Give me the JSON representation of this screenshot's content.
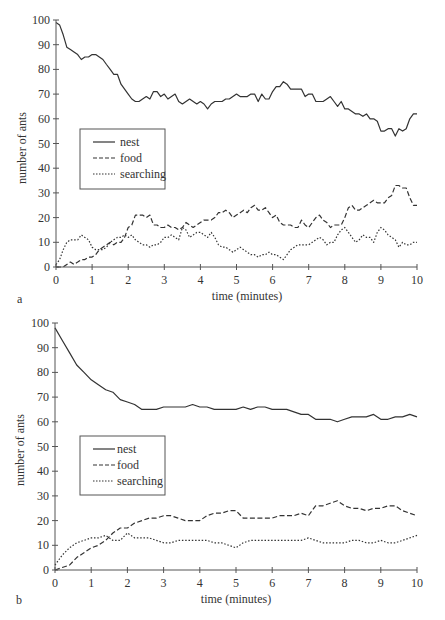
{
  "chart_data": [
    {
      "panel": "a",
      "type": "line",
      "title": "",
      "xlabel": "time (minutes)",
      "ylabel": "number of ants",
      "xlim": [
        0,
        10
      ],
      "ylim": [
        0,
        100
      ],
      "xticks": [
        0,
        1,
        2,
        3,
        4,
        5,
        6,
        7,
        8,
        9,
        10
      ],
      "yticks": [
        0,
        10,
        20,
        30,
        40,
        50,
        60,
        70,
        80,
        90,
        100
      ],
      "grid": false,
      "legend_position": "inside-left-middle",
      "legend": [
        "nest",
        "food",
        "searching"
      ],
      "series": [
        {
          "name": "nest",
          "style": "solid",
          "x": [
            0,
            0.1,
            0.2,
            0.3,
            0.4,
            0.5,
            0.6,
            0.7,
            0.8,
            0.9,
            1.0,
            1.1,
            1.2,
            1.3,
            1.4,
            1.5,
            1.6,
            1.7,
            1.8,
            1.9,
            2.0,
            2.1,
            2.2,
            2.3,
            2.4,
            2.5,
            2.6,
            2.7,
            2.8,
            2.9,
            3.0,
            3.1,
            3.2,
            3.3,
            3.4,
            3.5,
            3.6,
            3.7,
            3.8,
            3.9,
            4.0,
            4.1,
            4.2,
            4.3,
            4.4,
            4.5,
            4.6,
            4.7,
            4.8,
            4.9,
            5.0,
            5.1,
            5.2,
            5.3,
            5.4,
            5.5,
            5.6,
            5.7,
            5.8,
            5.9,
            6.0,
            6.1,
            6.2,
            6.3,
            6.4,
            6.5,
            6.6,
            6.7,
            6.8,
            6.9,
            7.0,
            7.1,
            7.2,
            7.3,
            7.4,
            7.5,
            7.6,
            7.7,
            7.8,
            7.9,
            8.0,
            8.1,
            8.2,
            8.3,
            8.4,
            8.5,
            8.6,
            8.7,
            8.8,
            8.9,
            9.0,
            9.1,
            9.2,
            9.3,
            9.4,
            9.5,
            9.6,
            9.7,
            9.8,
            9.9,
            10.0
          ],
          "values": [
            99,
            98,
            94,
            89,
            88,
            87,
            86,
            84,
            85,
            85,
            86,
            86,
            85,
            84,
            82,
            80,
            78,
            78,
            74,
            72,
            70,
            68,
            67,
            67,
            68,
            69,
            68,
            71,
            71,
            69,
            70,
            68,
            69,
            70,
            67,
            66,
            67,
            68,
            67,
            66,
            67,
            66,
            64,
            66,
            67,
            67,
            67,
            68,
            68,
            69,
            70,
            69,
            69,
            69,
            70,
            70,
            67,
            70,
            68,
            68,
            71,
            73,
            73,
            75,
            74,
            72,
            72,
            72,
            72,
            69,
            70,
            70,
            67,
            67,
            67,
            68,
            69,
            67,
            65,
            67,
            64,
            64,
            63,
            62,
            62,
            61,
            62,
            60,
            60,
            59,
            55,
            55,
            56,
            56,
            53,
            56,
            55,
            56,
            60,
            62,
            62
          ]
        },
        {
          "name": "food",
          "style": "dashed",
          "x": [
            0,
            0.1,
            0.2,
            0.3,
            0.4,
            0.5,
            0.6,
            0.7,
            0.8,
            0.9,
            1.0,
            1.1,
            1.2,
            1.3,
            1.4,
            1.5,
            1.6,
            1.7,
            1.8,
            1.9,
            2.0,
            2.1,
            2.2,
            2.3,
            2.4,
            2.5,
            2.6,
            2.7,
            2.8,
            2.9,
            3.0,
            3.1,
            3.2,
            3.3,
            3.4,
            3.5,
            3.6,
            3.7,
            3.8,
            3.9,
            4.0,
            4.1,
            4.2,
            4.3,
            4.4,
            4.5,
            4.6,
            4.7,
            4.8,
            4.9,
            5.0,
            5.1,
            5.2,
            5.3,
            5.4,
            5.5,
            5.6,
            5.7,
            5.8,
            5.9,
            6.0,
            6.1,
            6.2,
            6.3,
            6.4,
            6.5,
            6.6,
            6.7,
            6.8,
            6.9,
            7.0,
            7.1,
            7.2,
            7.3,
            7.4,
            7.5,
            7.6,
            7.7,
            7.8,
            7.9,
            8.0,
            8.1,
            8.2,
            8.3,
            8.4,
            8.5,
            8.6,
            8.7,
            8.8,
            8.9,
            9.0,
            9.1,
            9.2,
            9.3,
            9.4,
            9.5,
            9.6,
            9.7,
            9.8,
            9.9,
            10.0
          ],
          "values": [
            0,
            0,
            0,
            1,
            2,
            1,
            2,
            3,
            3,
            4,
            4,
            5,
            7,
            8,
            9,
            10,
            9,
            10,
            10,
            12,
            16,
            17,
            21,
            21,
            21,
            20,
            21,
            17,
            17,
            16,
            16,
            17,
            16,
            16,
            15,
            16,
            18,
            17,
            16,
            17,
            18,
            19,
            19,
            19,
            20,
            22,
            22,
            23,
            22,
            20,
            21,
            22,
            23,
            22,
            24,
            25,
            23,
            23,
            24,
            22,
            20,
            21,
            18,
            17,
            17,
            17,
            16,
            16,
            19,
            17,
            16,
            18,
            20,
            21,
            19,
            18,
            16,
            17,
            17,
            17,
            20,
            24,
            25,
            23,
            23,
            24,
            25,
            26,
            27,
            26,
            26,
            26,
            28,
            29,
            33,
            33,
            32,
            32,
            28,
            25,
            25
          ]
        },
        {
          "name": "searching",
          "style": "dotted",
          "x": [
            0,
            0.1,
            0.2,
            0.3,
            0.4,
            0.5,
            0.6,
            0.7,
            0.8,
            0.9,
            1.0,
            1.1,
            1.2,
            1.3,
            1.4,
            1.5,
            1.6,
            1.7,
            1.8,
            1.9,
            2.0,
            2.1,
            2.2,
            2.3,
            2.4,
            2.5,
            2.6,
            2.7,
            2.8,
            2.9,
            3.0,
            3.1,
            3.2,
            3.3,
            3.4,
            3.5,
            3.6,
            3.7,
            3.8,
            3.9,
            4.0,
            4.1,
            4.2,
            4.3,
            4.4,
            4.5,
            4.6,
            4.7,
            4.8,
            4.9,
            5.0,
            5.1,
            5.2,
            5.3,
            5.4,
            5.5,
            5.6,
            5.7,
            5.8,
            5.9,
            6.0,
            6.1,
            6.2,
            6.3,
            6.4,
            6.5,
            6.6,
            6.7,
            6.8,
            6.9,
            7.0,
            7.1,
            7.2,
            7.3,
            7.4,
            7.5,
            7.6,
            7.7,
            7.8,
            7.9,
            8.0,
            8.1,
            8.2,
            8.3,
            8.4,
            8.5,
            8.6,
            8.7,
            8.8,
            8.9,
            9.0,
            9.1,
            9.2,
            9.3,
            9.4,
            9.5,
            9.6,
            9.7,
            9.8,
            9.9,
            10.0
          ],
          "values": [
            1,
            3,
            7,
            10,
            11,
            11,
            11,
            13,
            12,
            11,
            8,
            7,
            7,
            7,
            8,
            10,
            11,
            12,
            12,
            13,
            12,
            13,
            11,
            10,
            9,
            9,
            8,
            9,
            9,
            10,
            12,
            12,
            13,
            12,
            11,
            16,
            15,
            12,
            13,
            14,
            14,
            13,
            12,
            14,
            12,
            9,
            8,
            8,
            7,
            6,
            7,
            8,
            7,
            6,
            5,
            5,
            4,
            5,
            5,
            6,
            5,
            5,
            4,
            3,
            5,
            7,
            8,
            9,
            9,
            9,
            9,
            10,
            11,
            12,
            11,
            9,
            10,
            10,
            13,
            15,
            16,
            14,
            12,
            10,
            11,
            13,
            12,
            12,
            10,
            14,
            16,
            15,
            13,
            12,
            11,
            8,
            10,
            9,
            9,
            10,
            10
          ]
        }
      ]
    },
    {
      "panel": "b",
      "type": "line",
      "title": "",
      "xlabel": "time (minutes)",
      "ylabel": "number of ants",
      "xlim": [
        0,
        10
      ],
      "ylim": [
        0,
        100
      ],
      "xticks": [
        0,
        1,
        2,
        3,
        4,
        5,
        6,
        7,
        8,
        9,
        10
      ],
      "yticks": [
        0,
        10,
        20,
        30,
        40,
        50,
        60,
        70,
        80,
        90,
        100
      ],
      "grid": false,
      "legend_position": "inside-left-middle",
      "legend": [
        "nest",
        "food",
        "searching"
      ],
      "series": [
        {
          "name": "nest",
          "style": "solid",
          "x": [
            0,
            0.2,
            0.4,
            0.6,
            0.8,
            1.0,
            1.2,
            1.4,
            1.6,
            1.8,
            2.0,
            2.2,
            2.4,
            2.6,
            2.8,
            3.0,
            3.2,
            3.4,
            3.6,
            3.8,
            4.0,
            4.2,
            4.4,
            4.6,
            4.8,
            5.0,
            5.2,
            5.4,
            5.6,
            5.8,
            6.0,
            6.2,
            6.4,
            6.6,
            6.8,
            7.0,
            7.2,
            7.4,
            7.6,
            7.8,
            8.0,
            8.2,
            8.4,
            8.6,
            8.8,
            9.0,
            9.2,
            9.4,
            9.6,
            9.8,
            10.0
          ],
          "values": [
            98,
            93,
            88,
            83,
            80,
            77,
            75,
            73,
            72,
            69,
            68,
            67,
            65,
            65,
            65,
            66,
            66,
            66,
            66,
            67,
            66,
            66,
            65,
            65,
            65,
            65,
            66,
            65,
            66,
            66,
            65,
            65,
            65,
            64,
            63,
            63,
            61,
            61,
            61,
            60,
            61,
            62,
            62,
            62,
            63,
            61,
            61,
            62,
            62,
            63,
            62
          ]
        },
        {
          "name": "food",
          "style": "dashed",
          "x": [
            0,
            0.2,
            0.4,
            0.6,
            0.8,
            1.0,
            1.2,
            1.4,
            1.6,
            1.8,
            2.0,
            2.2,
            2.4,
            2.6,
            2.8,
            3.0,
            3.2,
            3.4,
            3.6,
            3.8,
            4.0,
            4.2,
            4.4,
            4.6,
            4.8,
            5.0,
            5.2,
            5.4,
            5.6,
            5.8,
            6.0,
            6.2,
            6.4,
            6.6,
            6.8,
            7.0,
            7.2,
            7.4,
            7.6,
            7.8,
            8.0,
            8.2,
            8.4,
            8.6,
            8.8,
            9.0,
            9.2,
            9.4,
            9.6,
            9.8,
            10.0
          ],
          "values": [
            0,
            1,
            2,
            5,
            7,
            9,
            10,
            12,
            15,
            17,
            17,
            19,
            20,
            21,
            21,
            22,
            22,
            21,
            20,
            20,
            20,
            22,
            23,
            23,
            24,
            24,
            21,
            21,
            21,
            21,
            21,
            22,
            22,
            22,
            23,
            22,
            26,
            26,
            27,
            28,
            26,
            25,
            25,
            24,
            25,
            25,
            26,
            26,
            24,
            23,
            22
          ]
        },
        {
          "name": "searching",
          "style": "dotted",
          "x": [
            0,
            0.2,
            0.4,
            0.6,
            0.8,
            1.0,
            1.2,
            1.4,
            1.6,
            1.8,
            2.0,
            2.2,
            2.4,
            2.6,
            2.8,
            3.0,
            3.2,
            3.4,
            3.6,
            3.8,
            4.0,
            4.2,
            4.4,
            4.6,
            4.8,
            5.0,
            5.2,
            5.4,
            5.6,
            5.8,
            6.0,
            6.2,
            6.4,
            6.6,
            6.8,
            7.0,
            7.2,
            7.4,
            7.6,
            7.8,
            8.0,
            8.2,
            8.4,
            8.6,
            8.8,
            9.0,
            9.2,
            9.4,
            9.6,
            9.8,
            10.0
          ],
          "values": [
            2,
            6,
            9,
            11,
            12,
            13,
            13,
            14,
            12,
            12,
            15,
            13,
            13,
            13,
            12,
            11,
            11,
            12,
            12,
            12,
            12,
            12,
            11,
            11,
            10,
            9,
            11,
            12,
            12,
            12,
            12,
            12,
            12,
            12,
            12,
            13,
            12,
            11,
            11,
            11,
            11,
            12,
            12,
            11,
            11,
            12,
            11,
            11,
            12,
            13,
            14
          ]
        }
      ]
    }
  ],
  "panels": [
    {
      "label": "a",
      "xlabel": "time (minutes)",
      "ylabel": "number of ants",
      "legend": {
        "nest": "nest",
        "food": "food",
        "searching": "searching"
      }
    },
    {
      "label": "b",
      "xlabel": "time (minutes)",
      "ylabel": "number of ants",
      "legend": {
        "nest": "nest",
        "food": "food",
        "searching": "searching"
      }
    }
  ]
}
